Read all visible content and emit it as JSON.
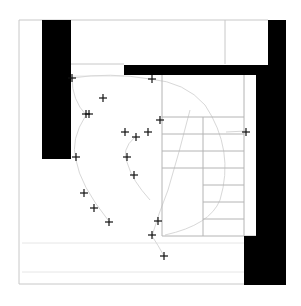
{
  "canvas": {
    "width": 301,
    "height": 306,
    "background": "#ffffff"
  },
  "colors": {
    "wall": "#000000",
    "frame_line": "#c8c8c8",
    "grid_line": "#b4b4b4",
    "faint_line": "#e6e6e6",
    "path_curve": "#d8d8d8",
    "marker": "#111111"
  },
  "frame": {
    "x": 19,
    "y": 20,
    "width": 262,
    "height": 124
  },
  "outer_frame_lines": [
    {
      "x1": 19,
      "y1": 20,
      "x2": 118,
      "y2": 20
    },
    {
      "x1": 118,
      "y1": 20,
      "x2": 268,
      "y2": 20
    },
    {
      "x1": 19,
      "y1": 20,
      "x2": 19,
      "y2": 284
    },
    {
      "x1": 19,
      "y1": 284,
      "x2": 244,
      "y2": 284
    },
    {
      "x1": 225,
      "y1": 20,
      "x2": 225,
      "y2": 64
    },
    {
      "x1": 70,
      "y1": 64,
      "x2": 124,
      "y2": 64
    }
  ],
  "walls": [
    {
      "name": "left-wall",
      "x": 42,
      "y": 20,
      "width": 29,
      "height": 139
    },
    {
      "name": "top-beam",
      "x": 124,
      "y": 65,
      "width": 144,
      "height": 10
    },
    {
      "name": "right-wall-upper",
      "x": 268,
      "y": 20,
      "width": 18,
      "height": 265
    },
    {
      "name": "right-wall-inner",
      "x": 256,
      "y": 75,
      "width": 12,
      "height": 210
    },
    {
      "name": "right-wall-lower",
      "x": 244,
      "y": 236,
      "width": 24,
      "height": 49
    }
  ],
  "stair_block": {
    "x": 162,
    "y": 75,
    "width": 94,
    "height": 161,
    "outline": [
      {
        "x1": 162,
        "y1": 75,
        "x2": 162,
        "y2": 236
      },
      {
        "x1": 162,
        "y1": 236,
        "x2": 256,
        "y2": 236
      },
      {
        "x1": 244,
        "y1": 75,
        "x2": 244,
        "y2": 236
      }
    ],
    "center_line": {
      "x1": 203,
      "y1": 117,
      "x2": 203,
      "y2": 236
    },
    "treads_full": [
      117,
      134,
      151,
      168
    ],
    "treads_right": [
      185,
      202,
      219
    ],
    "tread_left_x": 162,
    "tread_mid_x": 203,
    "tread_right_x": 244
  },
  "faint_horizontal_lines": [
    {
      "x1": 70,
      "y1": 76,
      "x2": 124,
      "y2": 76
    },
    {
      "x1": 22,
      "y1": 243,
      "x2": 244,
      "y2": 243
    },
    {
      "x1": 22,
      "y1": 272,
      "x2": 244,
      "y2": 272
    }
  ],
  "curves": [
    {
      "name": "left-arc",
      "d": "M 72 78 Q 72 100 86 115 Q 70 140 76 160 Q 80 185 108 220"
    },
    {
      "name": "top-arc",
      "d": "M 72 78 Q 110 72 150 79 Q 185 82 205 105"
    },
    {
      "name": "center-arc",
      "d": "M 135 137 Q 120 150 128 165 Q 132 180 150 200"
    },
    {
      "name": "stair-curve-right",
      "d": "M 205 105 Q 235 150 220 200 Q 210 225 165 235"
    },
    {
      "name": "stair-curve-left",
      "d": "M 190 110 Q 180 150 168 190 Q 158 215 152 236 Q 158 245 164 256"
    },
    {
      "name": "right-tail",
      "d": "M 226 132 L 246 131"
    }
  ],
  "markers": [
    {
      "x": 72,
      "y": 78
    },
    {
      "x": 152,
      "y": 79
    },
    {
      "x": 103,
      "y": 98
    },
    {
      "x": 86,
      "y": 114
    },
    {
      "x": 89,
      "y": 114
    },
    {
      "x": 160,
      "y": 120
    },
    {
      "x": 125,
      "y": 132
    },
    {
      "x": 136,
      "y": 137
    },
    {
      "x": 148,
      "y": 132
    },
    {
      "x": 246,
      "y": 132
    },
    {
      "x": 76,
      "y": 157
    },
    {
      "x": 127,
      "y": 157
    },
    {
      "x": 134,
      "y": 175
    },
    {
      "x": 84,
      "y": 193
    },
    {
      "x": 94,
      "y": 208
    },
    {
      "x": 109,
      "y": 222
    },
    {
      "x": 158,
      "y": 221
    },
    {
      "x": 152,
      "y": 235
    },
    {
      "x": 164,
      "y": 256
    }
  ],
  "marker_size": 4
}
